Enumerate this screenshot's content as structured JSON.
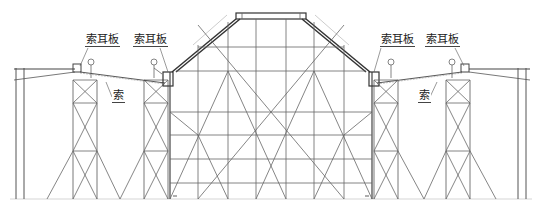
{
  "diagram": {
    "type": "structural-elevation",
    "colors": {
      "line": "#555555",
      "heavy": "#333333",
      "background": "#ffffff"
    }
  },
  "labels": {
    "lug_plate_1": "索耳板",
    "lug_plate_2": "索耳板",
    "lug_plate_3": "索耳板",
    "lug_plate_4": "索耳板",
    "cable_left": "索",
    "cable_right": "索"
  }
}
